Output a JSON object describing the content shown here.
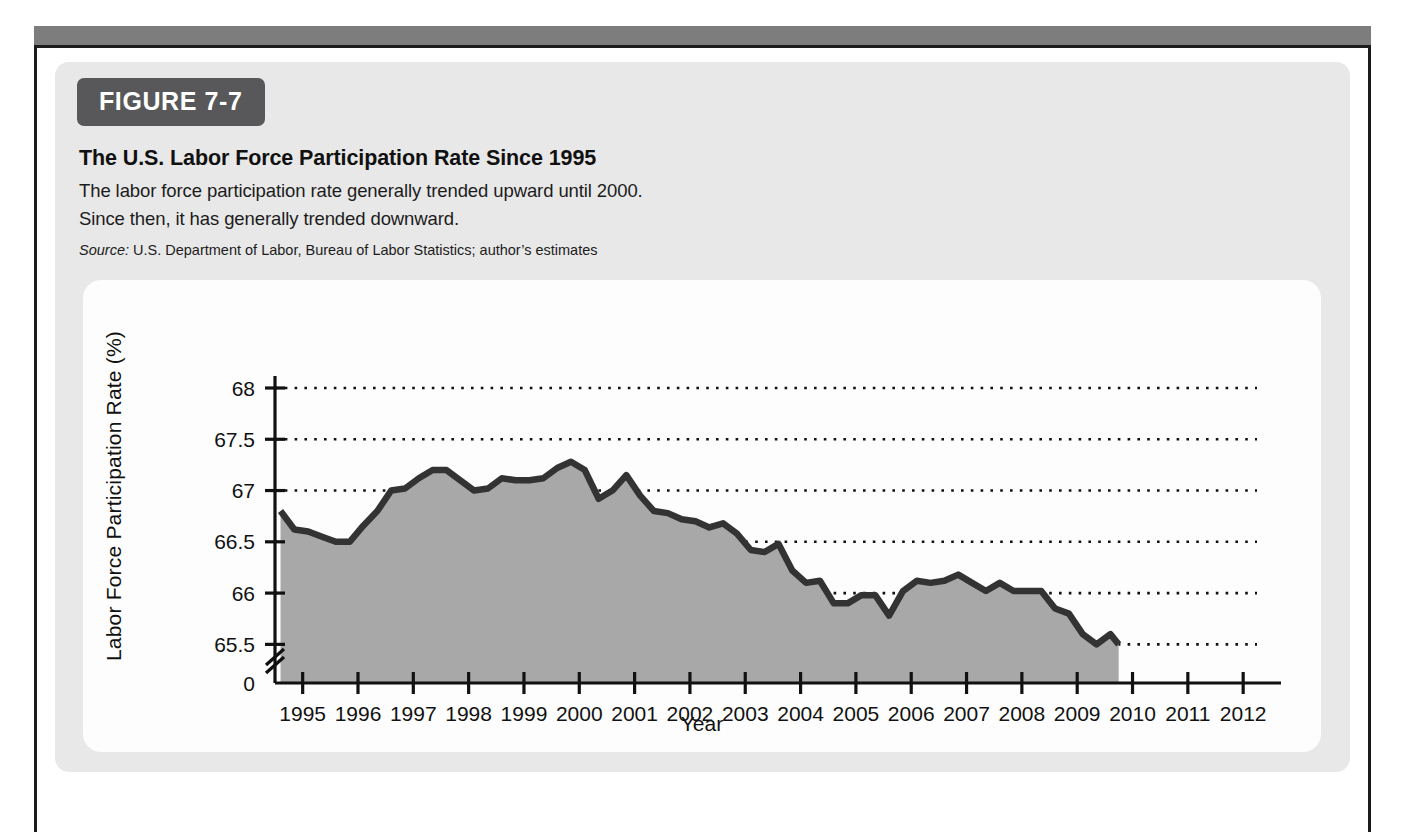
{
  "figure": {
    "badge": "FIGURE 7-7",
    "title": "The U.S. Labor Force Participation Rate Since 1995",
    "subtitle_line1": "The labor force participation rate generally trended upward until 2000.",
    "subtitle_line2": "Since then, it has generally trended downward.",
    "source_label": "Source:",
    "source_text": "U.S. Department of Labor, Bureau of Labor Statistics; author’s estimates"
  },
  "colors": {
    "badge_background": "#58585a",
    "card_background": "#e8e8e8",
    "panel_background": "#fdfdfd",
    "area_fill": "#a8a8a8",
    "line_stroke": "#333333",
    "grid_dots": "#111111",
    "axis": "#111111",
    "frame_rule": "#7d7d7d",
    "frame_border": "#1b1b1b"
  },
  "chart_data": {
    "type": "area",
    "title": "The U.S. Labor Force Participation Rate Since 1995",
    "xlabel": "Year",
    "ylabel": "Labor Force Participation Rate (%)",
    "grid": true,
    "legend": "none",
    "y_axis_break": true,
    "ylim": [
      65.25,
      68
    ],
    "y_ticks": [
      "0",
      "65.5",
      "66",
      "66.5",
      "67",
      "67.5",
      "68"
    ],
    "y_tick_values": [
      0,
      65.5,
      66,
      66.5,
      67,
      67.5,
      68
    ],
    "xlim": [
      1994.5,
      2012.25
    ],
    "x_ticks": [
      "1995",
      "1996",
      "1997",
      "1998",
      "1999",
      "2000",
      "2001",
      "2002",
      "2003",
      "2004",
      "2005",
      "2006",
      "2007",
      "2008",
      "2009",
      "2010",
      "2011",
      "2012"
    ],
    "x_tick_values": [
      1995,
      1996,
      1997,
      1998,
      1999,
      2000,
      2001,
      2002,
      2003,
      2004,
      2005,
      2006,
      2007,
      2008,
      2009,
      2010,
      2011,
      2012
    ],
    "series": [
      {
        "name": "Labor force participation rate",
        "x": [
          1994.6,
          1994.85,
          1995.1,
          1995.35,
          1995.6,
          1995.85,
          1996.1,
          1996.35,
          1996.6,
          1996.85,
          1997.1,
          1997.35,
          1997.6,
          1997.85,
          1998.1,
          1998.35,
          1998.6,
          1998.85,
          1999.1,
          1999.35,
          1999.6,
          1999.85,
          2000.1,
          2000.35,
          2000.6,
          2000.85,
          2001.1,
          2001.35,
          2001.6,
          2001.85,
          2002.1,
          2002.35,
          2002.6,
          2002.85,
          2003.1,
          2003.35,
          2003.6,
          2003.85,
          2004.1,
          2004.35,
          2004.6,
          2004.85,
          2005.1,
          2005.35,
          2005.6,
          2005.85,
          2006.1,
          2006.35,
          2006.6,
          2006.85,
          2007.1,
          2007.35,
          2007.6,
          2007.85,
          2008.1,
          2008.35,
          2008.6,
          2008.85,
          2009.1,
          2009.35,
          2009.6,
          2009.75
        ],
        "y": [
          66.8,
          66.62,
          66.6,
          66.55,
          66.5,
          66.5,
          66.66,
          66.8,
          67.0,
          67.02,
          67.12,
          67.2,
          67.2,
          67.1,
          67.0,
          67.02,
          67.12,
          67.1,
          67.1,
          67.12,
          67.22,
          67.28,
          67.2,
          66.92,
          67.0,
          67.15,
          66.95,
          66.8,
          66.78,
          66.72,
          66.7,
          66.64,
          66.68,
          66.58,
          66.42,
          66.4,
          66.48,
          66.22,
          66.1,
          66.12,
          65.9,
          65.9,
          65.98,
          65.98,
          65.78,
          66.02,
          66.12,
          66.1,
          66.12,
          66.18,
          66.1,
          66.02,
          66.1,
          66.02,
          66.02,
          66.02,
          65.85,
          65.8,
          65.6,
          65.5,
          65.6,
          65.5
        ]
      }
    ]
  }
}
